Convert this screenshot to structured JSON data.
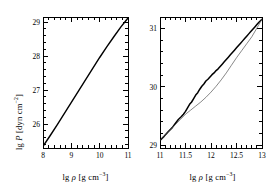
{
  "figure": {
    "background_color": "#ffffff",
    "foreground_color": "#000000",
    "thin_curve_color": "#555555"
  },
  "panels": [
    {
      "id": "left-panel",
      "xlabel_prefix": "lg",
      "xlabel_symbol": "ρ",
      "xlabel_units": "[g cm",
      "xlabel_exponent": "−3",
      "xlabel_close": "]",
      "ylabel_prefix": "lg",
      "ylabel_symbol": "P",
      "ylabel_units": "[dyn cm",
      "ylabel_exponent": "−2",
      "ylabel_close": "]",
      "xticks": [
        "8",
        "9",
        "10",
        "11"
      ],
      "yticks": [
        "26",
        "27",
        "28",
        "29"
      ]
    },
    {
      "id": "right-panel",
      "xlabel_prefix": "lg",
      "xlabel_symbol": "ρ",
      "xlabel_units": "[g cm",
      "xlabel_exponent": "−3",
      "xlabel_close": "]",
      "xticks": [
        "11",
        "11.5",
        "12",
        "12.5",
        "13"
      ],
      "yticks": [
        "29",
        "30",
        "31"
      ]
    }
  ],
  "chart_data": [
    {
      "type": "line",
      "id": "left-panel",
      "title": "",
      "xlabel": "lg ρ [g cm−3]",
      "ylabel": "lg P [dyn cm−2]",
      "xlim": [
        8.0,
        11.0
      ],
      "ylim": [
        25.3,
        29.15
      ],
      "xticks": [
        8,
        9,
        10,
        11
      ],
      "yticks": [
        26,
        27,
        28,
        29
      ],
      "grid": false,
      "legend": "none",
      "minor_ticks_per_interval": 5,
      "series": [
        {
          "name": "equation of state",
          "style": "solid",
          "width": 1.4,
          "color": "#000000",
          "x": [
            8.0,
            8.25,
            8.5,
            8.75,
            9.0,
            9.25,
            9.5,
            9.75,
            10.0,
            10.25,
            10.5,
            10.75,
            11.0
          ],
          "y": [
            25.35,
            25.66,
            25.98,
            26.31,
            26.64,
            26.97,
            27.3,
            27.63,
            27.96,
            28.27,
            28.57,
            28.86,
            29.12
          ]
        }
      ]
    },
    {
      "type": "line",
      "id": "right-panel",
      "title": "",
      "xlabel": "lg ρ [g cm−3]",
      "ylabel": "",
      "xlim": [
        11.0,
        13.0
      ],
      "ylim": [
        28.95,
        31.2
      ],
      "xticks": [
        11,
        11.5,
        12,
        12.5,
        13
      ],
      "yticks": [
        29,
        30,
        31
      ],
      "grid": false,
      "legend": "none",
      "minor_ticks_per_interval": 5,
      "series": [
        {
          "name": "shell-structure equation of state",
          "style": "solid-stepped",
          "width": 1.5,
          "color": "#000000",
          "x": [
            11.0,
            11.08,
            11.16,
            11.24,
            11.3,
            11.36,
            11.42,
            11.46,
            11.5,
            11.54,
            11.58,
            11.62,
            11.66,
            11.7,
            11.74,
            11.78,
            11.82,
            11.86,
            11.9,
            11.94,
            11.98,
            12.02,
            12.06,
            12.1,
            12.14,
            12.18,
            12.22,
            12.26,
            12.3,
            12.34,
            12.38,
            12.42,
            12.46,
            12.5,
            12.54,
            12.58,
            12.62,
            12.66,
            12.7,
            12.74,
            12.78,
            12.82,
            12.86,
            12.9,
            12.94,
            13.0
          ],
          "y": [
            29.08,
            29.15,
            29.23,
            29.3,
            29.37,
            29.44,
            29.49,
            29.53,
            29.58,
            29.64,
            29.7,
            29.74,
            29.8,
            29.86,
            29.9,
            29.96,
            30.01,
            30.05,
            30.1,
            30.13,
            30.17,
            30.21,
            30.24,
            30.28,
            30.31,
            30.35,
            30.39,
            30.43,
            30.47,
            30.51,
            30.55,
            30.59,
            30.63,
            30.67,
            30.71,
            30.75,
            30.79,
            30.83,
            30.87,
            30.91,
            30.95,
            30.99,
            31.03,
            31.07,
            31.11,
            31.16
          ]
        },
        {
          "name": "smooth equation of state",
          "style": "solid-thin",
          "width": 0.7,
          "color": "#555555",
          "x": [
            11.0,
            11.1,
            11.2,
            11.3,
            11.4,
            11.5,
            11.6,
            11.7,
            11.8,
            11.9,
            12.0,
            12.1,
            12.2,
            12.3,
            12.4,
            12.5,
            12.6,
            12.7,
            12.8,
            12.9,
            13.0
          ],
          "y": [
            29.08,
            29.17,
            29.26,
            29.35,
            29.44,
            29.53,
            29.6,
            29.67,
            29.74,
            29.82,
            29.91,
            30.01,
            30.12,
            30.24,
            30.37,
            30.5,
            30.62,
            30.74,
            30.86,
            31.01,
            31.16
          ]
        }
      ]
    }
  ]
}
